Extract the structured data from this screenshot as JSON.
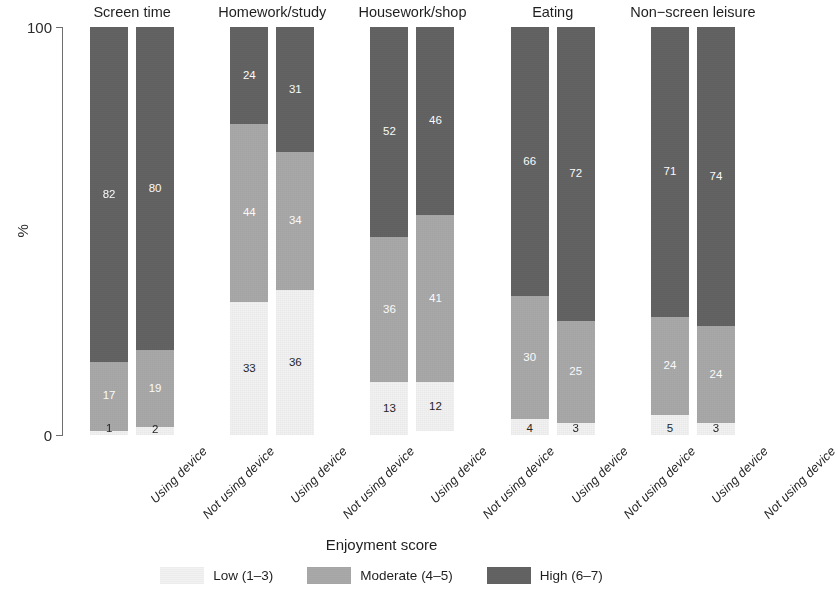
{
  "chart_data": {
    "type": "bar",
    "subtype": "stacked-percent-faceted",
    "title": "",
    "xlabel": "",
    "ylabel": "%",
    "ylim": [
      0,
      100
    ],
    "yticks": [
      "0",
      "100"
    ],
    "grid": false,
    "legend_title": "Enjoyment score",
    "legend_position": "bottom",
    "series": [
      {
        "name": "Low (1–3)",
        "key": "low",
        "color": "#f2f2f2"
      },
      {
        "name": "Moderate (4–5)",
        "key": "mod",
        "color": "#a9a9a9"
      },
      {
        "name": "High (6–7)",
        "key": "high",
        "color": "#636363"
      }
    ],
    "group_labels": [
      "Using device",
      "Not using device"
    ],
    "panels": [
      {
        "title": "Screen time",
        "bars": [
          {
            "group": "Using device",
            "low": 1,
            "mod": 17,
            "high": 82
          },
          {
            "group": "Not using device",
            "low": 2,
            "mod": 19,
            "high": 80
          }
        ]
      },
      {
        "title": "Homework/study",
        "bars": [
          {
            "group": "Using device",
            "low": 33,
            "mod": 44,
            "high": 24
          },
          {
            "group": "Not using device",
            "low": 36,
            "mod": 34,
            "high": 31
          }
        ]
      },
      {
        "title": "Housework/shop",
        "bars": [
          {
            "group": "Using device",
            "low": 13,
            "mod": 36,
            "high": 52
          },
          {
            "group": "Not using device",
            "low": 12,
            "mod": 41,
            "high": 46
          }
        ]
      },
      {
        "title": "Eating",
        "bars": [
          {
            "group": "Using device",
            "low": 4,
            "mod": 30,
            "high": 66
          },
          {
            "group": "Not using device",
            "low": 3,
            "mod": 25,
            "high": 72
          }
        ]
      },
      {
        "title": "Non−screen leisure",
        "bars": [
          {
            "group": "Using device",
            "low": 5,
            "mod": 24,
            "high": 71
          },
          {
            "group": "Not using device",
            "low": 3,
            "mod": 24,
            "high": 74
          }
        ]
      }
    ]
  },
  "axis": {
    "y_label": "%",
    "y_tick_top": "100",
    "y_tick_bottom": "0"
  },
  "legend": {
    "title": "Enjoyment score",
    "items": [
      {
        "label": "Low (1–3)"
      },
      {
        "label": "Moderate (4–5)"
      },
      {
        "label": "High (6–7)"
      }
    ]
  }
}
